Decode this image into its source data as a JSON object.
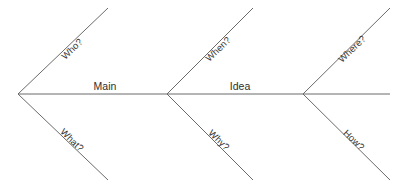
{
  "diagram": {
    "type": "fishbone-ishikawa",
    "title": "",
    "background_color": "#ffffff",
    "line_color": "#6b6b6b",
    "text_color": "#3a3a3a",
    "spine": {
      "labels": [
        {
          "id": "main",
          "text": "Main",
          "x": 105,
          "y": 91
        },
        {
          "id": "idea",
          "text": "Idea",
          "x": 240,
          "y": 91
        }
      ]
    },
    "branches": [
      {
        "id": "who",
        "text": "Who?",
        "direction": "up",
        "label_x": 72,
        "label_y": 49
      },
      {
        "id": "what",
        "text": "What?",
        "direction": "down",
        "label_x": 72,
        "label_y": 140
      },
      {
        "id": "when",
        "text": "When?",
        "direction": "up",
        "label_x": 218,
        "label_y": 49
      },
      {
        "id": "why",
        "text": "Why?",
        "direction": "down",
        "label_x": 219,
        "label_y": 140
      },
      {
        "id": "where",
        "text": "Where?",
        "direction": "up",
        "label_x": 352,
        "label_y": 49
      },
      {
        "id": "how",
        "text": "How?",
        "direction": "down",
        "label_x": 354,
        "label_y": 140
      }
    ]
  }
}
